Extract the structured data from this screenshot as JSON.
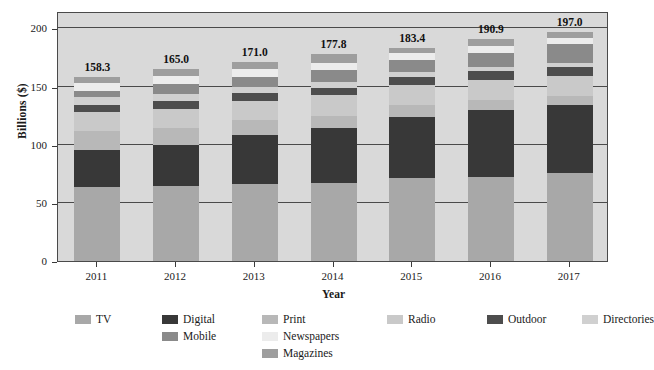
{
  "chart_data": {
    "type": "bar",
    "stacked": true,
    "title": "",
    "xlabel": "Year",
    "ylabel": "Billions ($)",
    "categories": [
      "2011",
      "2012",
      "2013",
      "2014",
      "2015",
      "2016",
      "2017"
    ],
    "ylim": [
      0,
      215
    ],
    "yticks": [
      0,
      50,
      100,
      150,
      200
    ],
    "ytick_labels": [
      "0",
      "50",
      "100",
      "150",
      "200"
    ],
    "grid": true,
    "legend_position": "below",
    "totals": [
      158.3,
      165.0,
      171.0,
      177.8,
      183.4,
      190.9,
      197.0
    ],
    "total_labels": [
      "158.3",
      "165.0",
      "171.0",
      "177.8",
      "183.4",
      "190.9",
      "197.0"
    ],
    "series": [
      {
        "name": "TV",
        "color": "#a8a8a8",
        "values": [
          64.0,
          64.5,
          66.5,
          67.0,
          71.5,
          72.0,
          75.5
        ]
      },
      {
        "name": "Digital",
        "color": "#383838",
        "values": [
          31.5,
          35.0,
          42.0,
          47.0,
          52.5,
          57.5,
          58.5
        ]
      },
      {
        "name": "Print",
        "color": "#b8b8b8",
        "values": [
          16.0,
          14.5,
          12.5,
          11.0,
          10.0,
          9.0,
          8.0
        ]
      },
      {
        "name": "Radio",
        "color": "#c9c9c9",
        "values": [
          16.5,
          17.0,
          17.0,
          17.5,
          17.5,
          17.5,
          17.5
        ]
      },
      {
        "name": "Outdoor",
        "color": "#4d4d4d",
        "values": [
          6.5,
          6.5,
          6.5,
          6.5,
          6.5,
          7.0,
          7.0
        ]
      },
      {
        "name": "Directories",
        "color": "#d0d0d0",
        "values": [
          6.5,
          6.0,
          5.5,
          5.0,
          4.5,
          4.0,
          3.5
        ]
      },
      {
        "name": "Mobile",
        "color": "#8a8a8a",
        "values": [
          5.0,
          9.0,
          8.5,
          10.0,
          10.0,
          12.0,
          16.5
        ]
      },
      {
        "name": "Newspapers",
        "color": "#ececec",
        "values": [
          7.5,
          7.0,
          6.5,
          6.5,
          6.0,
          6.0,
          5.5
        ]
      },
      {
        "name": "Magazines",
        "color": "#9e9e9e",
        "values": [
          4.8,
          5.5,
          6.0,
          7.3,
          4.9,
          5.9,
          5.0
        ]
      }
    ]
  },
  "legend": {
    "items": [
      {
        "label": "TV",
        "color": "#a8a8a8",
        "col": 0,
        "row": 0
      },
      {
        "label": "Digital",
        "color": "#383838",
        "col": 1,
        "row": 0
      },
      {
        "label": "Print",
        "color": "#b8b8b8",
        "col": 2,
        "row": 0
      },
      {
        "label": "Radio",
        "color": "#c9c9c9",
        "col": 3,
        "row": 0
      },
      {
        "label": "Outdoor",
        "color": "#4d4d4d",
        "col": 4,
        "row": 0
      },
      {
        "label": "Directories",
        "color": "#d0d0d0",
        "col": 5,
        "row": 0
      },
      {
        "label": "Mobile",
        "color": "#8a8a8a",
        "col": 1,
        "row": 1
      },
      {
        "label": "Newspapers",
        "color": "#ececec",
        "col": 2,
        "row": 1
      },
      {
        "label": "Magazines",
        "color": "#9e9e9e",
        "col": 2,
        "row": 2
      }
    ]
  },
  "colors": {
    "plot_background": "#d9d9d9",
    "page_background": "#ffffff",
    "axis": "#4a4a4a",
    "text": "#1a1a1a"
  }
}
